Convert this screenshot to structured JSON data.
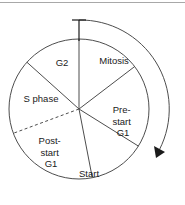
{
  "figure": {
    "name": "cell-cycle-wheel",
    "background_color": "#ffffff",
    "line_color": "#4d4d4d",
    "text_color": "#1a1a1a",
    "rule_color": "#a8a8a8"
  },
  "diagram": {
    "type": "cycle-wheel",
    "center": {
      "x": 79,
      "y": 109
    },
    "radius": 70,
    "direction": "clockwise",
    "start_marker": "tick-at-top",
    "arrow_position": "lower-right",
    "sectors": [
      {
        "id": "mitosis",
        "label": "Mitosis",
        "lines": [
          "Mitosis"
        ],
        "start_angle_deg": 0,
        "end_angle_deg": 52,
        "label_x": 114,
        "label_y": 61,
        "boundary_style": "solid"
      },
      {
        "id": "pre-start-g1",
        "label": "Pre-start G1",
        "lines": [
          "Pre-",
          "start",
          "G1"
        ],
        "start_angle_deg": 52,
        "end_angle_deg": 122,
        "label_x": 123,
        "label_y": 119,
        "boundary_style": "solid"
      },
      {
        "id": "start",
        "label": "Start",
        "lines": [
          "Start"
        ],
        "start_angle_deg": 122,
        "end_angle_deg": 169,
        "label_x": 89,
        "label_y": 174,
        "boundary_style": "solid"
      },
      {
        "id": "post-start-g1",
        "label": "Post-start G1",
        "lines": [
          "Post-",
          "start",
          "G1"
        ],
        "start_angle_deg": 169,
        "end_angle_deg": 225,
        "label_x": 51,
        "label_y": 150,
        "boundary_style": "dashed"
      },
      {
        "id": "s-phase",
        "label": "S phase",
        "lines": [
          "S phase"
        ],
        "start_angle_deg": 225,
        "end_angle_deg": 312,
        "label_x": 40,
        "label_y": 99,
        "boundary_style": "solid"
      },
      {
        "id": "g2",
        "label": "G2",
        "lines": [
          "G2"
        ],
        "start_angle_deg": 312,
        "end_angle_deg": 360,
        "label_x": 62,
        "label_y": 63,
        "boundary_style": "solid"
      }
    ]
  }
}
